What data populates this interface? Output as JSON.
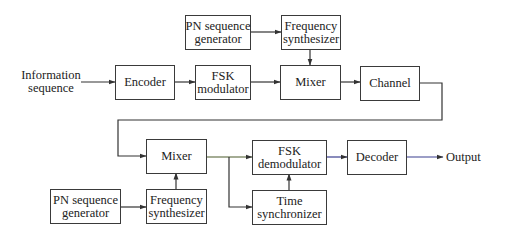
{
  "diagram": {
    "input_label": [
      "Information",
      "sequence"
    ],
    "output_label": "Output",
    "blocks": {
      "pn_gen_tx": [
        "PN sequence",
        "generator"
      ],
      "freq_synth_tx": [
        "Frequency",
        "synthesizer"
      ],
      "encoder": [
        "Encoder"
      ],
      "fsk_mod": [
        "FSK",
        "modulator"
      ],
      "mixer_tx": [
        "Mixer"
      ],
      "channel": [
        "Channel"
      ],
      "mixer_rx": [
        "Mixer"
      ],
      "fsk_demod": [
        "FSK",
        "demodulator"
      ],
      "decoder": [
        "Decoder"
      ],
      "pn_gen_rx": [
        "PN sequence",
        "generator"
      ],
      "freq_synth_rx": [
        "Frequency",
        "synthesizer"
      ],
      "time_sync": [
        "Time",
        "synchronizer"
      ]
    },
    "colors": {
      "line": "#333333",
      "box_border": "#3a3a3a",
      "accent_line": "#3b3f8f",
      "mixer_out_line": "#4a5a2a"
    },
    "connections": [
      {
        "from": "input",
        "to": "encoder"
      },
      {
        "from": "encoder",
        "to": "fsk_mod"
      },
      {
        "from": "fsk_mod",
        "to": "mixer_tx"
      },
      {
        "from": "pn_gen_tx",
        "to": "freq_synth_tx"
      },
      {
        "from": "freq_synth_tx",
        "to": "mixer_tx"
      },
      {
        "from": "mixer_tx",
        "to": "channel"
      },
      {
        "from": "channel",
        "to": "mixer_rx"
      },
      {
        "from": "pn_gen_rx",
        "to": "freq_synth_rx"
      },
      {
        "from": "freq_synth_rx",
        "to": "mixer_rx"
      },
      {
        "from": "mixer_rx",
        "to": "fsk_demod"
      },
      {
        "from": "mixer_rx",
        "to": "time_sync"
      },
      {
        "from": "time_sync",
        "to": "fsk_demod"
      },
      {
        "from": "fsk_demod",
        "to": "decoder"
      },
      {
        "from": "decoder",
        "to": "output"
      }
    ]
  }
}
